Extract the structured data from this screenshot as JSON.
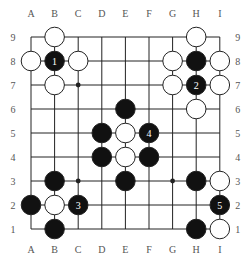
{
  "board": {
    "size": 9,
    "columns": [
      "A",
      "B",
      "C",
      "D",
      "E",
      "F",
      "G",
      "H",
      "I"
    ],
    "rows": [
      "9",
      "8",
      "7",
      "6",
      "5",
      "4",
      "3",
      "2",
      "1"
    ],
    "colors": {
      "line": "#222222",
      "black": "#111111",
      "white": "#ffffff",
      "label": "#555555"
    },
    "star_points": [
      "C7",
      "C3",
      "G3"
    ],
    "stones": [
      {
        "pos": "B9",
        "color": "white"
      },
      {
        "pos": "A8",
        "color": "white"
      },
      {
        "pos": "B8",
        "color": "black",
        "label": "1"
      },
      {
        "pos": "C8",
        "color": "white"
      },
      {
        "pos": "B7",
        "color": "white"
      },
      {
        "pos": "H9",
        "color": "white"
      },
      {
        "pos": "G8",
        "color": "white"
      },
      {
        "pos": "H8",
        "color": "black"
      },
      {
        "pos": "I8",
        "color": "white"
      },
      {
        "pos": "G7",
        "color": "white"
      },
      {
        "pos": "H7",
        "color": "black",
        "label": "2"
      },
      {
        "pos": "I7",
        "color": "white"
      },
      {
        "pos": "H6",
        "color": "white"
      },
      {
        "pos": "E6",
        "color": "black"
      },
      {
        "pos": "D5",
        "color": "black"
      },
      {
        "pos": "E5",
        "color": "white"
      },
      {
        "pos": "F5",
        "color": "black",
        "label": "4"
      },
      {
        "pos": "D4",
        "color": "black"
      },
      {
        "pos": "E4",
        "color": "white"
      },
      {
        "pos": "F4",
        "color": "black"
      },
      {
        "pos": "B3",
        "color": "black"
      },
      {
        "pos": "E3",
        "color": "black"
      },
      {
        "pos": "H3",
        "color": "black"
      },
      {
        "pos": "I3",
        "color": "white"
      },
      {
        "pos": "A2",
        "color": "black"
      },
      {
        "pos": "B2",
        "color": "white"
      },
      {
        "pos": "C2",
        "color": "black",
        "label": "3"
      },
      {
        "pos": "I2",
        "color": "black",
        "label": "5"
      },
      {
        "pos": "B1",
        "color": "black"
      },
      {
        "pos": "H1",
        "color": "black"
      },
      {
        "pos": "I1",
        "color": "white"
      }
    ]
  }
}
